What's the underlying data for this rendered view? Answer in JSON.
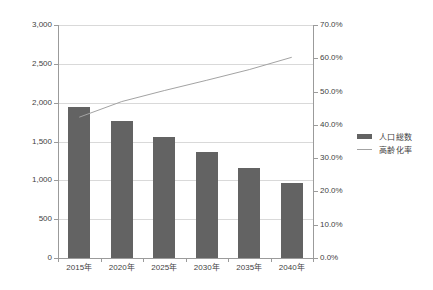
{
  "chart_data": {
    "type": "bar",
    "title": "",
    "subtitle": "",
    "xlabel": "",
    "ylabel": "",
    "categories": [
      "2015年",
      "2020年",
      "2025年",
      "2030年",
      "2035年",
      "2040年"
    ],
    "series": [
      {
        "name": "人口総数",
        "type": "bar",
        "axis": "left",
        "color": "#636363",
        "values": [
          1950,
          1760,
          1560,
          1360,
          1160,
          960
        ]
      },
      {
        "name": "高齢化率",
        "type": "line",
        "axis": "right",
        "color": "#a3a3a3",
        "values": [
          42.3,
          47.0,
          50.3,
          53.4,
          56.6,
          60.3
        ]
      }
    ],
    "left_axis": {
      "ylim": [
        0,
        3000
      ],
      "tick_step": 500,
      "ticks": [
        "0",
        "500",
        "1,000",
        "1,500",
        "2,000",
        "2,500",
        "3,000"
      ],
      "tick_values": [
        0,
        500,
        1000,
        1500,
        2000,
        2500,
        3000
      ]
    },
    "right_axis": {
      "ylim": [
        0,
        70
      ],
      "tick_step": 10,
      "ticks": [
        "0.0%",
        "10.0%",
        "20.0%",
        "30.0%",
        "40.0%",
        "50.0%",
        "60.0%",
        "70.0%"
      ],
      "tick_values": [
        0,
        10,
        20,
        30,
        40,
        50,
        60,
        70
      ]
    },
    "grid": true,
    "legend_position": "right",
    "legend": [
      "人口総数",
      "高齢化率"
    ]
  },
  "legend": {
    "items": [
      {
        "label": "人口総数",
        "marker": "bar-swatch"
      },
      {
        "label": "高齢化率",
        "marker": "line-swatch"
      }
    ]
  }
}
